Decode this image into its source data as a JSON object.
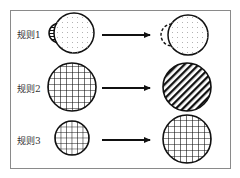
{
  "diagram": {
    "rules": [
      {
        "label": "规则1",
        "left_shape": "dotted-circle-with-striped-small-semicircle",
        "right_shape": "dotted-circle-with-dashed-semicircle"
      },
      {
        "label": "规则2",
        "left_shape": "crosshatch-grid-circle",
        "right_shape": "diagonal-striped-circle"
      },
      {
        "label": "规则3",
        "left_shape": "small-crosshatch-grid-circle",
        "right_shape": "large-crosshatch-grid-circle"
      }
    ],
    "colors": {
      "stroke": "#111111",
      "frame": "#8a8a8a",
      "dot": "#9a9a9a"
    }
  }
}
